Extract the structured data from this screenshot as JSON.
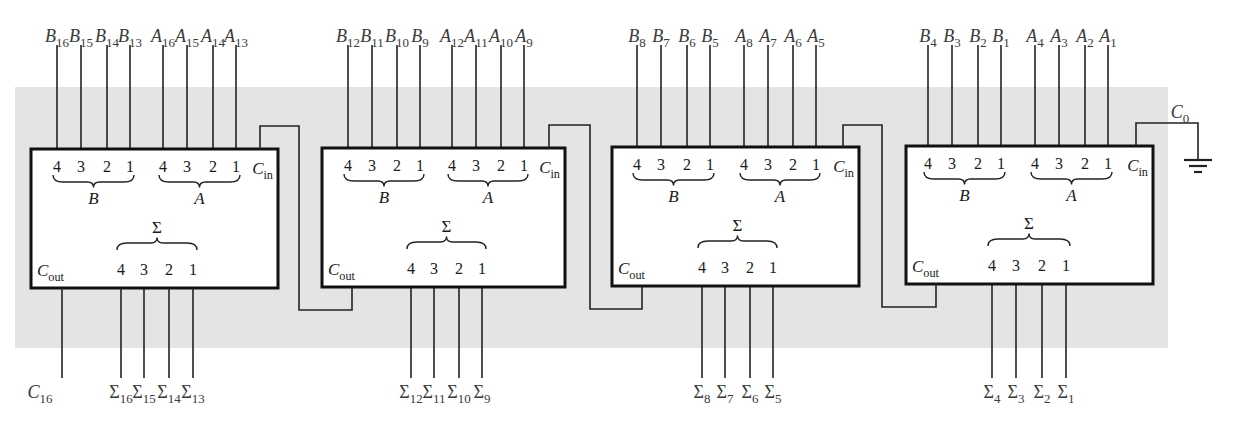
{
  "diagram": {
    "background_color": "#e4e4e4",
    "box_color": "#ffffff",
    "line_color": "#111111",
    "carry_in_label": "C",
    "carry_in_sub": "0",
    "carry_out_label": "C",
    "carry_out_sub": "16",
    "ground_icon": "ground-symbol",
    "blocks": [
      {
        "name": "adder-bits-16-13",
        "b_inputs": [
          {
            "base": "B",
            "sub": "16"
          },
          {
            "base": "B",
            "sub": "15"
          },
          {
            "base": "B",
            "sub": "14"
          },
          {
            "base": "B",
            "sub": "13"
          }
        ],
        "a_inputs": [
          {
            "base": "A",
            "sub": "16"
          },
          {
            "base": "A",
            "sub": "15"
          },
          {
            "base": "A",
            "sub": "14"
          },
          {
            "base": "A",
            "sub": "13"
          }
        ],
        "sum_outputs": [
          {
            "base": "Σ",
            "sub": "16"
          },
          {
            "base": "Σ",
            "sub": "15"
          },
          {
            "base": "Σ",
            "sub": "14"
          },
          {
            "base": "Σ",
            "sub": "13"
          }
        ]
      },
      {
        "name": "adder-bits-12-9",
        "b_inputs": [
          {
            "base": "B",
            "sub": "12"
          },
          {
            "base": "B",
            "sub": "11"
          },
          {
            "base": "B",
            "sub": "10"
          },
          {
            "base": "B",
            "sub": "9"
          }
        ],
        "a_inputs": [
          {
            "base": "A",
            "sub": "12"
          },
          {
            "base": "A",
            "sub": "11"
          },
          {
            "base": "A",
            "sub": "10"
          },
          {
            "base": "A",
            "sub": "9"
          }
        ],
        "sum_outputs": [
          {
            "base": "Σ",
            "sub": "12"
          },
          {
            "base": "Σ",
            "sub": "11"
          },
          {
            "base": "Σ",
            "sub": "10"
          },
          {
            "base": "Σ",
            "sub": "9"
          }
        ]
      },
      {
        "name": "adder-bits-8-5",
        "b_inputs": [
          {
            "base": "B",
            "sub": "8"
          },
          {
            "base": "B",
            "sub": "7"
          },
          {
            "base": "B",
            "sub": "6"
          },
          {
            "base": "B",
            "sub": "5"
          }
        ],
        "a_inputs": [
          {
            "base": "A",
            "sub": "8"
          },
          {
            "base": "A",
            "sub": "7"
          },
          {
            "base": "A",
            "sub": "6"
          },
          {
            "base": "A",
            "sub": "5"
          }
        ],
        "sum_outputs": [
          {
            "base": "Σ",
            "sub": "8"
          },
          {
            "base": "Σ",
            "sub": "7"
          },
          {
            "base": "Σ",
            "sub": "6"
          },
          {
            "base": "Σ",
            "sub": "5"
          }
        ]
      },
      {
        "name": "adder-bits-4-1",
        "b_inputs": [
          {
            "base": "B",
            "sub": "4"
          },
          {
            "base": "B",
            "sub": "3"
          },
          {
            "base": "B",
            "sub": "2"
          },
          {
            "base": "B",
            "sub": "1"
          }
        ],
        "a_inputs": [
          {
            "base": "A",
            "sub": "4"
          },
          {
            "base": "A",
            "sub": "3"
          },
          {
            "base": "A",
            "sub": "2"
          },
          {
            "base": "A",
            "sub": "1"
          }
        ],
        "sum_outputs": [
          {
            "base": "Σ",
            "sub": "4"
          },
          {
            "base": "Σ",
            "sub": "3"
          },
          {
            "base": "Σ",
            "sub": "2"
          },
          {
            "base": "Σ",
            "sub": "1"
          }
        ]
      }
    ],
    "block_labels": {
      "pin_numbers": [
        "4",
        "3",
        "2",
        "1"
      ],
      "b_group": "B",
      "a_group": "A",
      "sum_group": "Σ",
      "cin_base": "C",
      "cin_sub": "in",
      "cout_base": "C",
      "cout_sub": "out"
    }
  }
}
